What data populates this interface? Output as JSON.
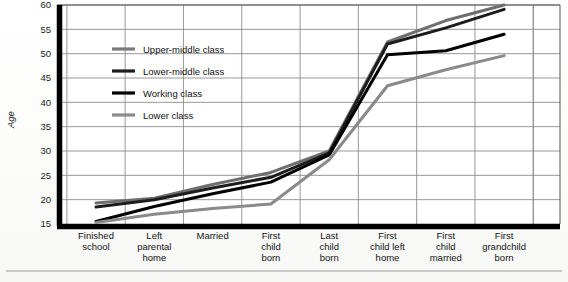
{
  "figure": {
    "background_color": "#fdfdfc",
    "plot_background": "#ffffff",
    "axis_color": "#000000",
    "grid_color": "#8c8c8c"
  },
  "chart_data": {
    "type": "line",
    "title": "",
    "xlabel": "",
    "ylabel": "Age",
    "ylim": [
      15,
      60
    ],
    "yticks": [
      15,
      20,
      25,
      30,
      35,
      40,
      45,
      50,
      55,
      60
    ],
    "ytick_labels": [
      "15",
      "20",
      "25",
      "30",
      "35",
      "40",
      "45",
      "50",
      "55",
      "60"
    ],
    "grid": true,
    "grid_axes": "both",
    "legend_position": "upper-left-inside",
    "categories": [
      "Finished school",
      "Left parental home",
      "Married",
      "First child born",
      "Last child born",
      "First child left home",
      "First child married",
      "First grandchild born"
    ],
    "category_label_lines": [
      [
        "Finished",
        "school"
      ],
      [
        "Left",
        "parental",
        "home"
      ],
      [
        "Married"
      ],
      [
        "First",
        "child",
        "born"
      ],
      [
        "Last",
        "child",
        "born"
      ],
      [
        "First",
        "child left",
        "home"
      ],
      [
        "First",
        "child",
        "married"
      ],
      [
        "First",
        "grandchild",
        "born"
      ]
    ],
    "series": [
      {
        "name": "Upper-middle class",
        "color": "#6e6e6e",
        "width": 3.0,
        "values": [
          19.3,
          20.3,
          23.1,
          25.6,
          30.0,
          52.4,
          56.8,
          60.0
        ]
      },
      {
        "name": "Lower-middle class",
        "color": "#1c1c1c",
        "width": 3.0,
        "values": [
          18.5,
          20.0,
          22.4,
          24.6,
          29.6,
          52.0,
          55.3,
          59.1
        ]
      },
      {
        "name": "Working class",
        "color": "#000000",
        "width": 3.0,
        "values": [
          15.5,
          18.6,
          21.2,
          23.6,
          29.2,
          49.8,
          50.6,
          54.0
        ]
      },
      {
        "name": "Lower class",
        "color": "#8a8a8a",
        "width": 3.0,
        "values": [
          15.3,
          17.0,
          18.2,
          19.1,
          28.2,
          43.4,
          46.7,
          49.6
        ]
      }
    ]
  },
  "legend": {
    "entries": [
      {
        "label": "Upper-middle class",
        "color": "#7a7a7a"
      },
      {
        "label": "Lower-middle class",
        "color": "#1c1c1c"
      },
      {
        "label": "Working class",
        "color": "#000000"
      },
      {
        "label": "Lower class",
        "color": "#8a8a8a"
      }
    ]
  },
  "footer": {
    "rule_visible": true
  }
}
